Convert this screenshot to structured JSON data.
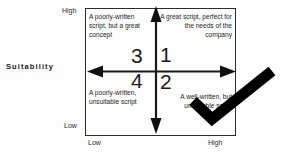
{
  "axes": {
    "y_title": "Suitability",
    "y_high": "High",
    "y_low": "Low",
    "x_low": "Low",
    "x_high": "High"
  },
  "quadrants": [
    {
      "number": "1",
      "position": "top-right",
      "text": "A great script, perfect for the needs of the company"
    },
    {
      "number": "2",
      "position": "bottom-right",
      "text": "A well-written, but unsuitable script"
    },
    {
      "number": "3",
      "position": "top-left",
      "text": "A poorly-written script, but a great concept"
    },
    {
      "number": "4",
      "position": "bottom-left",
      "text": "A poorly-written, unsuitable script"
    }
  ],
  "annotation": {
    "mark": "checkmark",
    "color": "#000000"
  },
  "colors": {
    "frame": "#2b2b2b",
    "text": "#1a1a1a",
    "background": "#fdfdfd"
  }
}
